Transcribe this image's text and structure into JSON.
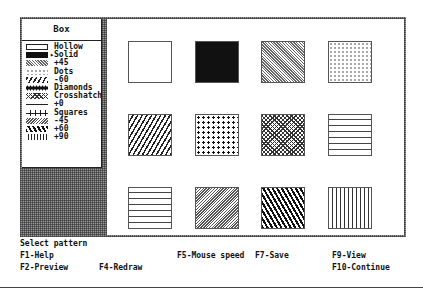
{
  "menu": {
    "title": "Box",
    "selected_index": 1,
    "selected_marker": "▸",
    "items": [
      {
        "label": "Hollow",
        "pattern": "hollow"
      },
      {
        "label": "Solid",
        "pattern": "solid"
      },
      {
        "label": "+45",
        "pattern": "p45"
      },
      {
        "label": "Dots",
        "pattern": "dots"
      },
      {
        "label": "-60",
        "pattern": "m60"
      },
      {
        "label": "Diamonds",
        "pattern": "diamonds"
      },
      {
        "label": "Crosshatch",
        "pattern": "cross"
      },
      {
        "label": "+0",
        "pattern": "zero"
      },
      {
        "label": "Squares",
        "pattern": "squares"
      },
      {
        "label": "-45",
        "pattern": "m45"
      },
      {
        "label": "+60",
        "pattern": "p60"
      },
      {
        "label": "+90",
        "pattern": "p90"
      }
    ]
  },
  "canvas": {
    "swatches": [
      {
        "pattern": "hollow"
      },
      {
        "pattern": "solid"
      },
      {
        "pattern": "p45"
      },
      {
        "pattern": "dots"
      },
      {
        "pattern": "m60"
      },
      {
        "pattern": "diamonds"
      },
      {
        "pattern": "cross"
      },
      {
        "pattern": "zero"
      },
      {
        "pattern": "squares"
      },
      {
        "pattern": "m45"
      },
      {
        "pattern": "p60"
      },
      {
        "pattern": "p90"
      }
    ]
  },
  "status": {
    "prompt": "Select pattern"
  },
  "function_keys": {
    "f1": "F1-Help",
    "f2": "F2-Preview",
    "f4": "F4-Redraw",
    "f5": "F5-Mouse speed",
    "f7": "F7-Save",
    "f9": "F9-View",
    "f10": "F10-Continue"
  }
}
